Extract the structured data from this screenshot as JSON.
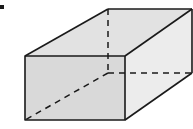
{
  "diagram": {
    "type": "rectangular-prism",
    "colors": {
      "edge": "#1a1a1a",
      "front_face": "#d9d9d9",
      "top_face": "#e2e2e2",
      "side_face": "#ececec",
      "background": "#ffffff"
    },
    "vertices": {
      "front_top_left": [
        25,
        56
      ],
      "front_top_right": [
        125,
        56
      ],
      "front_bottom_right": [
        125,
        120
      ],
      "front_bottom_left": [
        25,
        120
      ],
      "back_top_left": [
        108,
        9
      ],
      "back_top_right": [
        192,
        9
      ],
      "back_bottom_right": [
        192,
        73
      ],
      "back_bottom_left": [
        108,
        73
      ]
    },
    "marker": {
      "label": "bullet",
      "position": [
        2,
        7
      ]
    }
  }
}
